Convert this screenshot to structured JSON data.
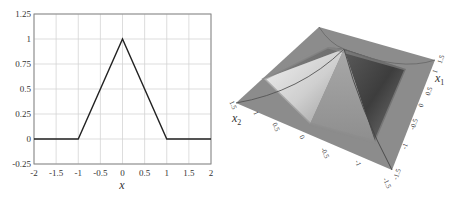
{
  "chart_data": [
    {
      "type": "line",
      "title": "",
      "xlabel": "x",
      "ylabel": "",
      "xlim": [
        -2,
        2
      ],
      "ylim": [
        -0.25,
        1.25
      ],
      "grid": true,
      "legend": null,
      "x_ticks": [
        -2,
        -1.5,
        -1,
        -0.5,
        0,
        0.5,
        1,
        1.5,
        2
      ],
      "x_tick_labels": [
        "-2",
        "-1.5",
        "-1",
        "-0.5",
        "0",
        "0.5",
        "1",
        "1.5",
        "2"
      ],
      "y_ticks": [
        -0.25,
        0,
        0.25,
        0.5,
        0.75,
        1,
        1.25
      ],
      "y_tick_labels": [
        "-0.25",
        "0",
        "0.25",
        "0.5",
        "0.75",
        "1",
        "1.25"
      ],
      "series": [
        {
          "name": "triangular function",
          "x": [
            -2,
            -1,
            0,
            1,
            2
          ],
          "y": [
            0,
            0,
            1,
            0,
            0
          ],
          "color": "#222222"
        }
      ]
    },
    {
      "type": "surface",
      "title": "",
      "xlabel": "x1",
      "ylabel": "x2",
      "zlabel": "",
      "x1_ticks": [
        -1.5,
        -1,
        -0.5,
        0,
        0.5,
        1,
        1.5
      ],
      "x1_tick_labels": [
        "-1.5",
        "-1",
        "-0.5",
        "0",
        "0.5",
        "1",
        "1.5"
      ],
      "x2_ticks": [
        -1.5,
        -1,
        -0.5,
        0,
        0.5,
        1,
        1.5
      ],
      "x2_tick_labels": [
        "-1.5",
        "-1",
        "-0.5",
        "0",
        "0.5",
        "1",
        "1.5"
      ],
      "description": "Pyramid-shaped 2D tent function: peak value 1 at (0,0), zero for |x1|>=1 or |x2|>=1, flat base over [-1.5,1.5]^2",
      "peak": {
        "x1": 0,
        "x2": 0,
        "z": 1
      },
      "support": [
        [
          -1,
          1
        ],
        [
          -1,
          1
        ]
      ],
      "domain": [
        [
          -1.5,
          1.5
        ],
        [
          -1.5,
          1.5
        ]
      ],
      "colors": {
        "base": "#8c8c8c",
        "light_face": "#d8d8d8",
        "dark_face": "#4a4a4a",
        "mid_face": "#9a9a9a",
        "edge": "#555555"
      }
    }
  ],
  "left_plot": {
    "x_axis_label": "x",
    "x_tick_labels": [
      "-2",
      "-1.5",
      "-1",
      "-0.5",
      "0",
      "0.5",
      "1",
      "1.5",
      "2"
    ],
    "y_tick_labels": [
      "1.25",
      "1",
      "0.75",
      "0.5",
      "0.25",
      "0",
      "-0.25"
    ]
  },
  "right_plot": {
    "x1_label": "x",
    "x1_sub": "1",
    "x2_label": "x",
    "x2_sub": "2",
    "x1_tick_labels": [
      "1.5",
      "1",
      "0.5",
      "0",
      "-0.5",
      "-1",
      "-1.5"
    ],
    "x2_tick_labels": [
      "1.5",
      "1",
      "0.5",
      "0",
      "-0.5",
      "-1",
      "-1.5"
    ]
  }
}
